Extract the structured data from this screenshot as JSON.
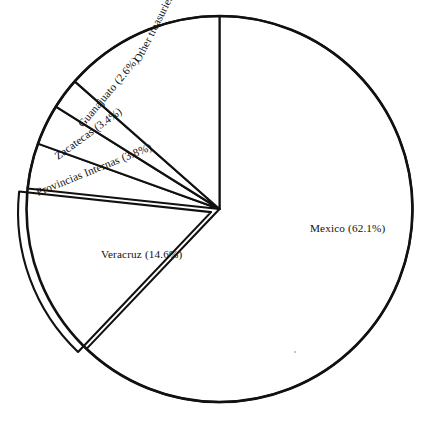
{
  "chart_data": {
    "type": "pie",
    "title": "",
    "subtitle": "",
    "xlabel": "",
    "ylabel": "",
    "legend_position": "none",
    "grid": false,
    "label_format": "name (percent%)",
    "categories": [
      "Mexico",
      "Veracruz",
      "Other treasuries",
      "Provincias Internas",
      "Zacatecas",
      "Guanajuato"
    ],
    "values": [
      62.1,
      14.6,
      13.5,
      3.8,
      3.4,
      2.6
    ],
    "slices": [
      {
        "name": "Mexico",
        "percent": 62.1,
        "label": "Mexico (62.1%)",
        "start_angle_deg": 0.0,
        "end_angle_deg": 223.56,
        "label_rotation_deg": 0,
        "label_x": 310,
        "label_y": 232,
        "exploded": false
      },
      {
        "name": "Veracruz",
        "percent": 14.6,
        "label": "Veracruz (14.6%)",
        "start_angle_deg": 223.56,
        "end_angle_deg": 276.12,
        "label_rotation_deg": 0,
        "label_x": 101,
        "label_y": 258,
        "exploded": true
      },
      {
        "name": "Provincias Internas",
        "percent": 3.8,
        "label": "Provincias Internas (3.8%)",
        "start_angle_deg": 276.12,
        "end_angle_deg": 289.8,
        "label_rotation_deg": -22,
        "label_x": 38,
        "label_y": 196,
        "exploded": false
      },
      {
        "name": "Zacatecas",
        "percent": 3.4,
        "label": "Zacatecas (3.4%)",
        "start_angle_deg": 289.8,
        "end_angle_deg": 302.04,
        "label_rotation_deg": -36,
        "label_x": 58,
        "label_y": 160,
        "exploded": false
      },
      {
        "name": "Guanajuato",
        "percent": 2.6,
        "label": "Guanajuato (2.6%)",
        "start_angle_deg": 302.04,
        "end_angle_deg": 311.4,
        "label_rotation_deg": -50,
        "label_x": 83,
        "label_y": 128,
        "exploded": false
      },
      {
        "name": "Other treasuries",
        "percent": 13.5,
        "label": "Other treasuries (13.5%)",
        "start_angle_deg": 311.4,
        "end_angle_deg": 360.0,
        "label_rotation_deg": -63,
        "label_x": 140,
        "label_y": 63,
        "exploded": false
      }
    ]
  },
  "colors": {
    "stroke": "#111111",
    "fill": "#ffffff",
    "background": "#ffffff"
  }
}
